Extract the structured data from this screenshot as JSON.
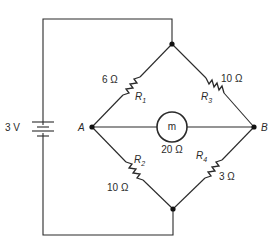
{
  "diagram": {
    "type": "wheatstone-bridge-circuit",
    "source": {
      "label": "3 V",
      "component": "battery"
    },
    "nodes": [
      {
        "id": "A",
        "label": "A"
      },
      {
        "id": "B",
        "label": "B"
      }
    ],
    "resistors": [
      {
        "id": "R1",
        "name": "R",
        "subscript": "1",
        "value": "6 Ω",
        "between": "top-A"
      },
      {
        "id": "R2",
        "name": "R",
        "subscript": "2",
        "value": "10 Ω",
        "between": "A-bottom"
      },
      {
        "id": "R3",
        "name": "R",
        "subscript": "3",
        "value": "10 Ω",
        "between": "top-B"
      },
      {
        "id": "R4",
        "name": "R",
        "subscript": "4",
        "value": "3 Ω",
        "between": "bottom-B"
      }
    ],
    "meter": {
      "symbol": "m",
      "value": "20 Ω",
      "between": "A-B"
    }
  }
}
